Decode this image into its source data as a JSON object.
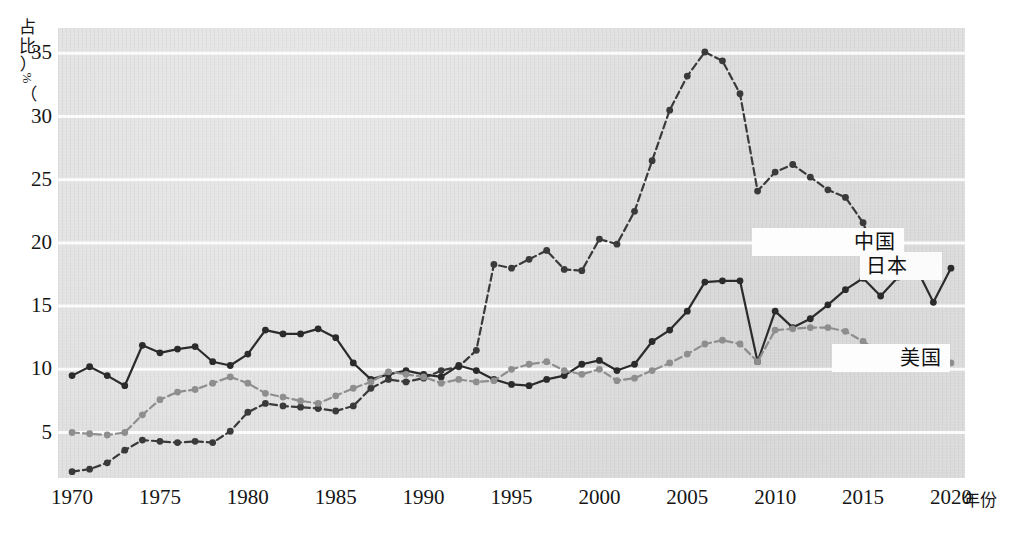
{
  "axes": {
    "y_caption": "占比（%）",
    "y_caption_chars": [
      "占",
      "比"
    ],
    "y_paren_open": "（",
    "y_pct": "%",
    "y_paren_close": "）",
    "x_caption": "年份",
    "y_ticks": [
      35,
      30,
      25,
      20,
      15,
      10,
      5
    ],
    "x_ticks": [
      1970,
      1975,
      1980,
      1985,
      1990,
      1995,
      2000,
      2005,
      2010,
      2015,
      2020
    ]
  },
  "labels": {
    "china": "中国",
    "japan": "日本",
    "usa": "美国"
  },
  "colors": {
    "plot_background": "#e0e0e0",
    "gridline": "#fbfbfb",
    "china": "#3a3a3a",
    "japan": "#2b2b2b",
    "usa": "#8e8e8e",
    "tick_text": "#151515"
  },
  "chart_data": {
    "type": "line",
    "title": "",
    "xlabel": "年份",
    "ylabel": "占比（%）",
    "xlim": [
      1969.2,
      2020.8
    ],
    "ylim": [
      1.4,
      37.0
    ],
    "grid": true,
    "grid_values": [
      35,
      30,
      25,
      20,
      15,
      10,
      5
    ],
    "legend_position": "inline-annotations",
    "x": [
      1970,
      1971,
      1972,
      1973,
      1974,
      1975,
      1976,
      1977,
      1978,
      1979,
      1980,
      1981,
      1982,
      1983,
      1984,
      1985,
      1986,
      1987,
      1988,
      1989,
      1990,
      1991,
      1992,
      1993,
      1994,
      1995,
      1996,
      1997,
      1998,
      1999,
      2000,
      2001,
      2002,
      2003,
      2004,
      2005,
      2006,
      2007,
      2008,
      2009,
      2010,
      2011,
      2012,
      2013,
      2014,
      2015,
      2016,
      2017,
      2018,
      2019,
      2020
    ],
    "series": [
      {
        "name": "中国",
        "style": "dashed",
        "color": "#3a3a3a",
        "values": [
          1.9,
          2.1,
          2.6,
          3.6,
          4.4,
          4.3,
          4.2,
          4.3,
          4.2,
          5.1,
          6.6,
          7.3,
          7.1,
          7.0,
          6.9,
          6.7,
          7.1,
          8.5,
          9.2,
          9.0,
          9.3,
          9.9,
          10.2,
          11.5,
          18.3,
          18.0,
          18.7,
          19.4,
          17.9,
          17.8,
          20.3,
          19.9,
          22.5,
          26.5,
          30.5,
          33.2,
          35.1,
          34.4,
          31.8,
          24.1,
          25.6,
          26.2,
          25.2,
          24.2,
          23.6,
          21.6,
          17.9,
          17.5,
          18.0,
          null,
          null
        ]
      },
      {
        "name": "日本",
        "style": "solid",
        "color": "#2b2b2b",
        "values": [
          9.5,
          10.2,
          9.5,
          8.7,
          11.9,
          11.3,
          11.6,
          11.8,
          10.6,
          10.3,
          11.2,
          13.1,
          12.8,
          12.8,
          13.2,
          12.5,
          10.5,
          9.2,
          9.6,
          9.9,
          9.6,
          9.4,
          10.3,
          9.9,
          9.2,
          8.8,
          8.7,
          9.2,
          9.5,
          10.4,
          10.7,
          9.9,
          10.4,
          12.2,
          13.1,
          14.6,
          16.9,
          17.0,
          17.0,
          10.6,
          14.6,
          13.3,
          14.0,
          15.1,
          16.3,
          17.2,
          15.8,
          17.3,
          18.1,
          15.3,
          18.0
        ]
      },
      {
        "name": "美国",
        "style": "dashed",
        "color": "#8e8e8e",
        "values": [
          5.0,
          4.9,
          4.8,
          5.0,
          6.4,
          7.6,
          8.2,
          8.4,
          8.9,
          9.4,
          8.9,
          8.1,
          7.8,
          7.5,
          7.3,
          7.9,
          8.5,
          9.0,
          9.8,
          9.6,
          9.4,
          8.9,
          9.2,
          9.0,
          9.1,
          10.0,
          10.4,
          10.6,
          9.9,
          9.6,
          10.0,
          9.1,
          9.3,
          9.9,
          10.5,
          11.2,
          12.0,
          12.3,
          12.0,
          10.6,
          13.1,
          13.2,
          13.3,
          13.3,
          13.0,
          12.2,
          11.4,
          11.0,
          10.9,
          10.4,
          10.5
        ]
      }
    ]
  }
}
